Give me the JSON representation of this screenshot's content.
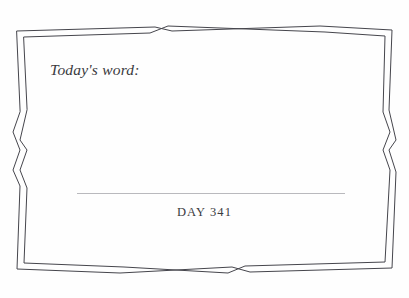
{
  "page": {
    "type": "journal-page",
    "background_color": "#fefefe",
    "ink_color": "#3a3a40",
    "rule_color": "#b9b9bd",
    "frame_color": "#45454c"
  },
  "prompt": {
    "label": "Today's word:"
  },
  "writing_area": {
    "rule_line_present": true
  },
  "footer": {
    "day_label": "DAY 341"
  },
  "frame": {
    "style": "double-line-ornamental-border",
    "ornament": "crossed-wave-midpoint"
  }
}
